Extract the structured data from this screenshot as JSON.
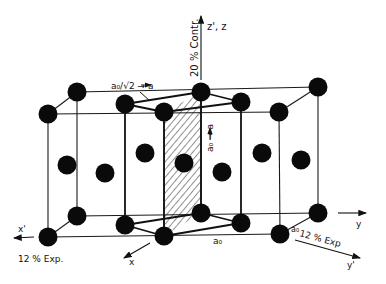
{
  "diagram": {
    "type": "crystal-lattice",
    "colors": {
      "atom": "#0a0a0a",
      "line": "#1a1a1a",
      "background": "#ffffff"
    },
    "labels": {
      "z_axis": "z', z",
      "z_contraction": "20 % Contr.",
      "ao_sqrt2": "a₀/√2 → a",
      "ao_vertical": "a₀ → a",
      "ao_bottom": "a₀",
      "ao_right": "a₀",
      "x_prime": "x'",
      "x_prime_expansion": "12 % Exp.",
      "x": "x",
      "y": "y",
      "y_prime": "y'",
      "y_prime_expansion": "12 % Exp"
    },
    "atoms": {
      "top": [
        [
          77,
          92
        ],
        [
          48,
          114
        ],
        [
          125,
          104
        ],
        [
          164,
          112
        ],
        [
          201,
          92
        ],
        [
          241,
          102
        ],
        [
          279,
          112
        ],
        [
          318,
          87
        ]
      ],
      "middle": [
        [
          67,
          165
        ],
        [
          105,
          173
        ],
        [
          145,
          153
        ],
        [
          184,
          163
        ],
        [
          222,
          172
        ],
        [
          262,
          153
        ],
        [
          301,
          160
        ]
      ],
      "bottom": [
        [
          77,
          216
        ],
        [
          48,
          237
        ],
        [
          125,
          225
        ],
        [
          164,
          236
        ],
        [
          201,
          213
        ],
        [
          241,
          223
        ],
        [
          280,
          234
        ],
        [
          318,
          213
        ]
      ]
    }
  }
}
